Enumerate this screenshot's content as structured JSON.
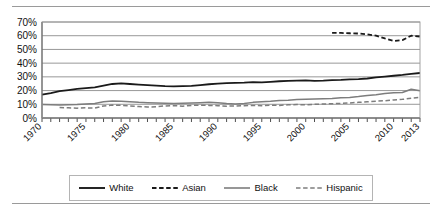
{
  "chart_data": {
    "type": "line",
    "title": "",
    "xlabel": "",
    "ylabel": "",
    "xlim": [
      1970,
      2013
    ],
    "ylim": [
      0,
      70
    ],
    "ytick_labels": [
      "0%",
      "10%",
      "20%",
      "30%",
      "40%",
      "50%",
      "60%",
      "70%"
    ],
    "ytick_values": [
      0,
      10,
      20,
      30,
      40,
      50,
      60,
      70
    ],
    "xtick_labels": [
      "1970",
      "1975",
      "1980",
      "1985",
      "1990",
      "1995",
      "2000",
      "2005",
      "2010",
      "2013"
    ],
    "xtick_values": [
      1970,
      1975,
      1980,
      1985,
      1990,
      1995,
      2000,
      2005,
      2010,
      2013
    ],
    "xtick_rotation": 45,
    "minor_xticks": "every year",
    "grid": "horizontal",
    "legend_position": "bottom",
    "series": [
      {
        "name": "White",
        "style": "solid",
        "color": "#1a1a1a",
        "width": 1.8,
        "x": [
          1970,
          1971,
          1972,
          1973,
          1974,
          1975,
          1976,
          1977,
          1978,
          1979,
          1980,
          1981,
          1982,
          1983,
          1984,
          1985,
          1986,
          1987,
          1988,
          1989,
          1990,
          1991,
          1992,
          1993,
          1994,
          1995,
          1996,
          1997,
          1998,
          1999,
          2000,
          2001,
          2002,
          2003,
          2004,
          2005,
          2006,
          2007,
          2008,
          2009,
          2010,
          2011,
          2012,
          2013
        ],
        "values": [
          17.0,
          18.2,
          19.6,
          20.4,
          21.2,
          21.8,
          22.4,
          23.6,
          24.8,
          25.2,
          24.8,
          24.4,
          24.0,
          23.6,
          23.2,
          23.0,
          23.2,
          23.4,
          24.0,
          24.6,
          25.0,
          25.4,
          25.6,
          25.8,
          26.2,
          26.0,
          26.4,
          26.8,
          27.0,
          27.2,
          27.4,
          27.0,
          27.2,
          27.6,
          27.8,
          28.2,
          28.4,
          28.8,
          29.6,
          30.2,
          30.8,
          31.4,
          32.2,
          32.8
        ]
      },
      {
        "name": "Asian",
        "style": "dashed",
        "color": "#1a1a1a",
        "width": 1.8,
        "x": [
          2003,
          2004,
          2005,
          2006,
          2007,
          2008,
          2009,
          2010,
          2011,
          2012,
          2013
        ],
        "values": [
          62.0,
          62.0,
          61.8,
          61.6,
          61.0,
          60.0,
          58.0,
          56.2,
          56.8,
          60.0,
          59.4
        ]
      },
      {
        "name": "Black",
        "style": "solid",
        "color": "#7d7d7d",
        "width": 1.5,
        "x": [
          1970,
          1971,
          1972,
          1973,
          1974,
          1975,
          1976,
          1977,
          1978,
          1979,
          1980,
          1981,
          1982,
          1983,
          1984,
          1985,
          1986,
          1987,
          1988,
          1989,
          1990,
          1991,
          1992,
          1993,
          1994,
          1995,
          1996,
          1997,
          1998,
          1999,
          2000,
          2001,
          2002,
          2003,
          2004,
          2005,
          2006,
          2007,
          2008,
          2009,
          2010,
          2011,
          2012,
          2013
        ],
        "values": [
          9.8,
          9.6,
          9.4,
          9.6,
          9.8,
          10.2,
          10.6,
          11.8,
          12.4,
          12.2,
          11.8,
          11.4,
          11.2,
          11.0,
          10.8,
          10.6,
          10.8,
          11.0,
          11.2,
          11.4,
          11.2,
          10.6,
          10.2,
          10.6,
          11.4,
          11.8,
          12.2,
          12.8,
          13.0,
          13.4,
          13.6,
          13.8,
          14.0,
          14.2,
          14.8,
          15.0,
          15.6,
          16.4,
          17.0,
          17.8,
          18.4,
          18.6,
          21.0,
          19.8
        ]
      },
      {
        "name": "Hispanic",
        "style": "dashed",
        "color": "#7d7d7d",
        "width": 1.5,
        "x": [
          1972,
          1973,
          1974,
          1975,
          1976,
          1977,
          1978,
          1979,
          1980,
          1981,
          1982,
          1983,
          1984,
          1985,
          1986,
          1987,
          1988,
          1989,
          1990,
          1991,
          1992,
          1993,
          1994,
          1995,
          1996,
          1997,
          1998,
          1999,
          2000,
          2001,
          2002,
          2003,
          2004,
          2005,
          2006,
          2007,
          2008,
          2009,
          2010,
          2011,
          2012,
          2013
        ],
        "values": [
          7.6,
          7.4,
          7.2,
          7.4,
          7.2,
          8.8,
          9.4,
          9.2,
          8.8,
          8.4,
          8.0,
          8.2,
          8.8,
          9.0,
          8.6,
          9.2,
          9.4,
          9.2,
          9.0,
          8.6,
          8.8,
          9.0,
          9.2,
          9.0,
          9.4,
          9.2,
          9.6,
          9.8,
          9.6,
          10.0,
          10.2,
          10.4,
          10.6,
          11.0,
          11.4,
          11.8,
          12.2,
          12.6,
          13.2,
          13.6,
          14.4,
          15.0
        ]
      }
    ]
  },
  "legend": {
    "items": [
      {
        "label": "White",
        "style": "solid",
        "color": "#1a1a1a"
      },
      {
        "label": "Asian",
        "style": "dashed",
        "color": "#1a1a1a"
      },
      {
        "label": "Black",
        "style": "solid",
        "color": "#7d7d7d"
      },
      {
        "label": "Hispanic",
        "style": "dashed",
        "color": "#7d7d7d"
      }
    ]
  }
}
